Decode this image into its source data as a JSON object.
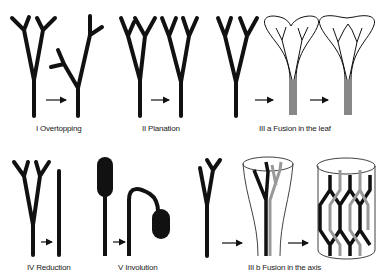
{
  "colors": {
    "ink": "#111111",
    "background": "#ffffff",
    "fused": "#9a9a9a"
  },
  "panels": [
    {
      "id": "overtopping",
      "label": "I Overtopping"
    },
    {
      "id": "planation",
      "label": "II Planation"
    },
    {
      "id": "fusion-leaf",
      "label": "III a Fusion in the leaf"
    },
    {
      "id": "reduction",
      "label": "IV Reduction"
    },
    {
      "id": "involution",
      "label": "V Involution"
    },
    {
      "id": "fusion-axis",
      "label": "III b Fusion in the axis"
    }
  ],
  "arrow_icon": "right-arrow-icon"
}
